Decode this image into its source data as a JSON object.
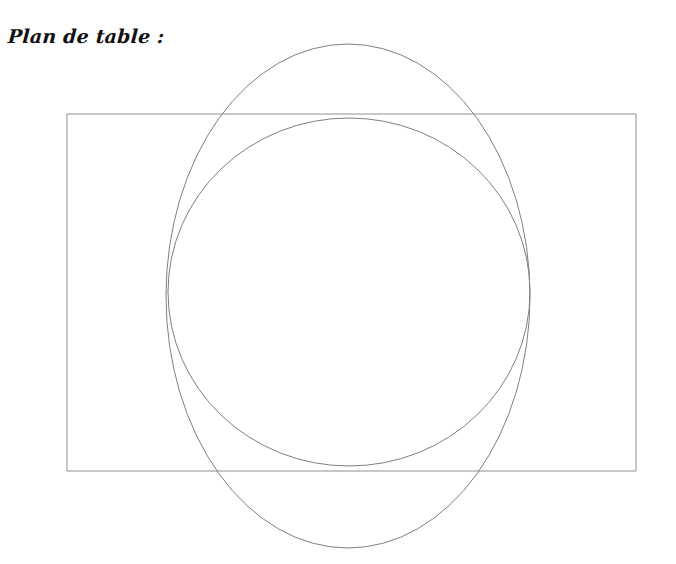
{
  "page": {
    "width": 676,
    "height": 564,
    "background_color": "#ffffff",
    "stroke_color": "#8a8a8a",
    "text_color": "#111111"
  },
  "heading": {
    "text": "Plan de table :",
    "language": "fr",
    "x": 8,
    "y": 27
  },
  "chart_data": {
    "type": "diagram",
    "title": "Plan de table :",
    "background": "#ffffff",
    "grid": false,
    "legend": null,
    "xlabel": "",
    "ylabel": "",
    "xlim": [
      0,
      676
    ],
    "ylim": [
      0,
      564
    ],
    "shapes": [
      {
        "name": "table-rectangle",
        "kind": "rect",
        "x": 67,
        "y": 114,
        "width": 569,
        "height": 357,
        "stroke": "#8f8f8f",
        "stroke_width": 1,
        "fill": "none"
      },
      {
        "name": "outer-ellipse",
        "kind": "ellipse",
        "cx": 348,
        "cy": 296,
        "rx": 182,
        "ry": 252,
        "stroke": "#7f7f7f",
        "stroke_width": 1,
        "fill": "none"
      },
      {
        "name": "inner-circle",
        "kind": "ellipse",
        "cx": 349,
        "cy": 292,
        "rx": 181,
        "ry": 174,
        "stroke": "#7f7f7f",
        "stroke_width": 1,
        "fill": "none"
      }
    ]
  }
}
